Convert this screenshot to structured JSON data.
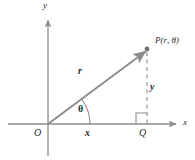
{
  "figure": {
    "colors": {
      "axis": "#8c8c8c",
      "vector": "#8c8c8c",
      "dashed": "#9a9a9a",
      "text": "#2b2b2b",
      "background": "#ffffff"
    },
    "labels": {
      "axis_y": "y",
      "axis_x": "x",
      "origin": "O",
      "point_q": "Q",
      "radius": "r",
      "angle": "θ",
      "leg_x": "x",
      "leg_y": "y",
      "point_p_prefix": "P(",
      "point_p_r": "r",
      "point_p_sep": ", ",
      "point_p_theta": "θ",
      "point_p_suffix": ")"
    },
    "geometry": {
      "origin": [
        48,
        124
      ],
      "point_p": [
        147,
        50
      ],
      "point_q": [
        147,
        124
      ],
      "x_axis_from": [
        8,
        124
      ],
      "x_axis_to": [
        178,
        124
      ],
      "y_axis_from": [
        48,
        18
      ],
      "y_axis_to": [
        48,
        156
      ],
      "angle_arc_radius": 42,
      "angle_degrees": 36.8,
      "right_angle_size": 11
    }
  }
}
